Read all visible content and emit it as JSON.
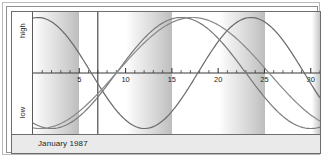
{
  "window": {
    "title": "Biorhythm",
    "footer_caption": "January 1987"
  },
  "axis": {
    "y_high_label": "high",
    "y_low_label": "low",
    "x_tick_labels": [
      "5",
      "10",
      "15",
      "20",
      "25",
      "30"
    ],
    "x_tick_values": [
      5,
      10,
      15,
      20,
      25,
      30
    ]
  },
  "colors": {
    "frame_outer": "#b9b9b9",
    "frame_inner": "#8d8d8d",
    "plot_border": "#6d6d6d",
    "band_light": "#ffffff",
    "band_dark": "#bdbdbd",
    "axis_line": "#3a3a3a",
    "today_line": "#3a3a3a",
    "curve_physical": "#6b6b6b",
    "curve_emotional": "#7a7a7a",
    "curve_intellectual": "#8a8a8a",
    "footer_bg": "#eaeaea",
    "text": "#1d1d1d"
  },
  "marker": {
    "today_label": "today",
    "today_value": 7
  },
  "chart_data": {
    "type": "line",
    "title": "",
    "subtitle": "",
    "xlabel": "",
    "ylabel": "",
    "xlim": [
      0,
      31
    ],
    "ylim": [
      -1,
      1
    ],
    "grid": false,
    "legend": "none",
    "bands": {
      "description": "alternating white-to-gray gradient bands, one per 5-day interval",
      "width_days": 5,
      "starts": [
        0,
        5,
        10,
        15,
        20,
        25,
        30
      ]
    },
    "x": [
      0,
      1,
      2,
      3,
      4,
      5,
      6,
      7,
      8,
      9,
      10,
      11,
      12,
      13,
      14,
      15,
      16,
      17,
      18,
      19,
      20,
      21,
      22,
      23,
      24,
      25,
      26,
      27,
      28,
      29,
      30,
      31
    ],
    "series": [
      {
        "name": "Physical",
        "period_days": 23,
        "phase_days": 5.2,
        "values": [
          0.93,
          0.99,
          0.97,
          0.86,
          0.68,
          0.44,
          0.16,
          -0.13,
          -0.41,
          -0.65,
          -0.84,
          -0.96,
          -1.0,
          -0.95,
          -0.82,
          -0.62,
          -0.37,
          -0.09,
          0.2,
          0.46,
          0.69,
          0.87,
          0.97,
          1.0,
          0.94,
          0.8,
          0.59,
          0.33,
          0.05,
          -0.24,
          -0.5,
          -0.72
        ]
      },
      {
        "name": "Emotional",
        "period_days": 28,
        "phase_days": 19.0,
        "values": [
          -0.43,
          -0.62,
          -0.78,
          -0.9,
          -0.97,
          -1.0,
          -0.97,
          -0.9,
          -0.78,
          -0.62,
          -0.43,
          -0.22,
          0.0,
          0.22,
          0.43,
          0.62,
          0.78,
          0.9,
          0.97,
          1.0,
          0.97,
          0.9,
          0.78,
          0.62,
          0.43,
          0.22,
          0.0,
          -0.22,
          -0.43,
          -0.62,
          -0.78,
          -0.9
        ]
      },
      {
        "name": "Intellectual",
        "period_days": 33,
        "phase_days": 24.0,
        "values": [
          -0.06,
          0.13,
          0.32,
          0.49,
          0.65,
          0.78,
          0.89,
          0.96,
          1.0,
          1.0,
          0.96,
          0.89,
          0.78,
          0.65,
          0.49,
          0.32,
          0.13,
          -0.06,
          -0.25,
          -0.43,
          -0.59,
          -0.73,
          -0.85,
          -0.94,
          -0.99,
          -1.0,
          -0.98,
          -0.92,
          -0.83,
          -0.7,
          -0.55,
          -0.38
        ]
      }
    ]
  }
}
